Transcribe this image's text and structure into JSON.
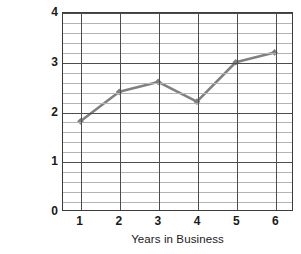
{
  "chart_data": {
    "type": "line",
    "title": "",
    "xlabel": "Years in Business",
    "ylabel_line1": "Students",
    "ylabel_line2": "in thousands",
    "x": [
      1,
      2,
      3,
      4,
      5,
      6
    ],
    "values": [
      1.8,
      2.4,
      2.6,
      2.2,
      3.0,
      3.2
    ],
    "xlim": [
      0.55,
      6.45
    ],
    "ylim": [
      0,
      4
    ],
    "xticks": [
      "1",
      "2",
      "3",
      "4",
      "5",
      "6"
    ],
    "yticks": [
      "0",
      "1",
      "2",
      "3",
      "4"
    ],
    "y_major_step": 1,
    "y_minor_step": 0.2,
    "grid": "horizontal-minor-and-major, vertical-at-xticks",
    "legend": "none",
    "series_color": "#808080",
    "marker": "diamond",
    "axis_color": "#3c3c3c",
    "gridline_color": "#b4b4b4",
    "major_gridline_color": "#4d4d4d"
  }
}
